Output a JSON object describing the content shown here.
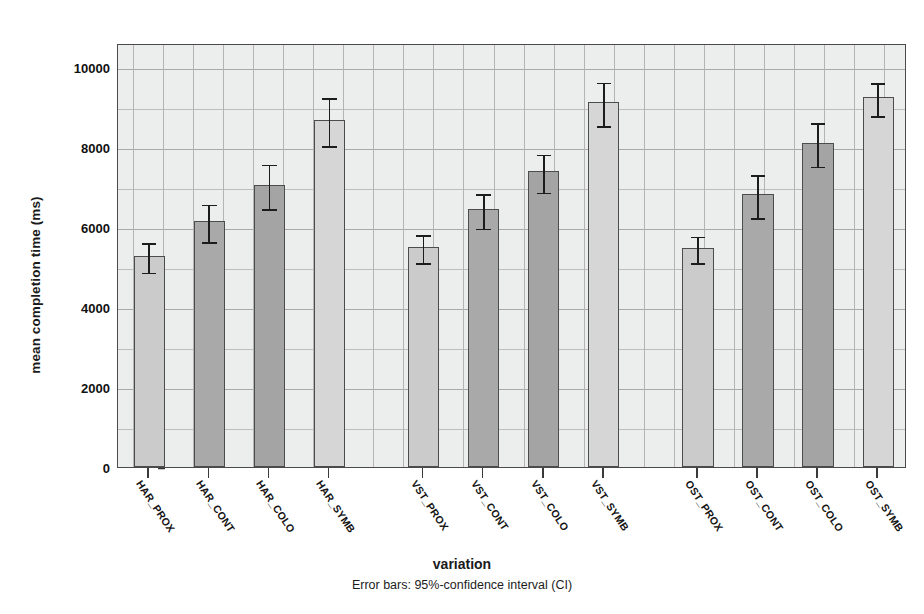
{
  "chart_data": {
    "type": "bar",
    "title": "",
    "xlabel": "variation",
    "ylabel": "mean completion time (ms)",
    "ylim": [
      0,
      10600
    ],
    "yticks": [
      0,
      2000,
      4000,
      6000,
      8000,
      10000
    ],
    "ytick_labels": [
      "0",
      "2000",
      "4000",
      "6000",
      "8000",
      "10000"
    ],
    "grid": true,
    "legend": "none",
    "error_note": "Error bars: 95%-confidence interval (CI)",
    "error_type": "95%-confidence interval (CI)",
    "groups": [
      "HAR",
      "VST",
      "OST"
    ],
    "categories": [
      "HAR_PROX",
      "HAR_CONT",
      "HAR_COLO",
      "HAR_SYMB",
      "VST_PROX",
      "VST_CONT",
      "VST_COLO",
      "VST_SYMB",
      "OST_PROX",
      "OST_CONT",
      "OST_COLO",
      "OST_SYMB"
    ],
    "values": [
      5280,
      6140,
      7050,
      8680,
      5500,
      6450,
      7390,
      9120,
      5480,
      6820,
      8100,
      9240
    ],
    "ci_low": [
      4910,
      5680,
      6500,
      8070,
      5150,
      6010,
      6910,
      8580,
      5150,
      6280,
      7560,
      8830
    ],
    "ci_high": [
      5650,
      6610,
      7610,
      9280,
      5850,
      6880,
      7860,
      9660,
      5810,
      7350,
      8650,
      9640
    ],
    "bar_colors": [
      "#cbcbcb",
      "#a9a9a9",
      "#a4a4a4",
      "#d6d6d6",
      "#cbcbcb",
      "#a9a9a9",
      "#a4a4a4",
      "#d6d6d6",
      "#cbcbcb",
      "#a9a9a9",
      "#a4a4a4",
      "#d6d6d6"
    ],
    "bar_edge_color": "#4c4c4c",
    "plot_background": "#eceded",
    "grid_color": "#b4b4b4",
    "error_bar_color": "#1c1c1c"
  }
}
